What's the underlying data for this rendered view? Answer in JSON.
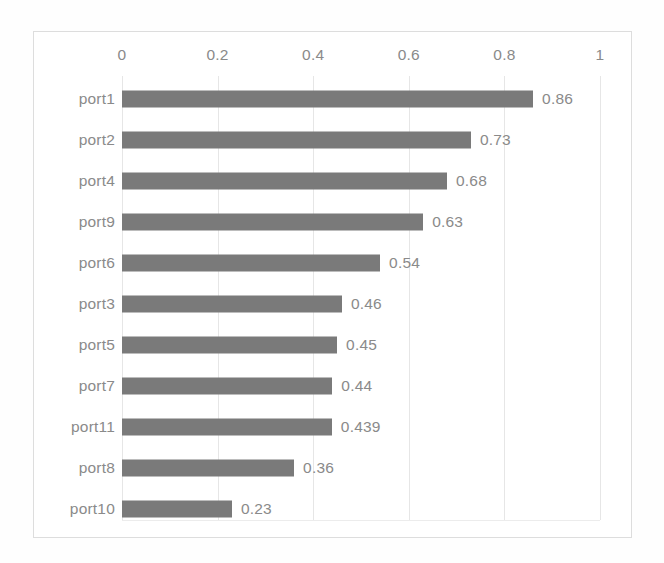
{
  "chart_data": {
    "type": "bar",
    "orientation": "horizontal",
    "title": "",
    "subtitle": "",
    "xlabel": "",
    "ylabel": "",
    "categories": [
      "port1",
      "port2",
      "port4",
      "port9",
      "port6",
      "port3",
      "port5",
      "port7",
      "port11",
      "port8",
      "port10"
    ],
    "values": [
      0.86,
      0.73,
      0.68,
      0.63,
      0.54,
      0.46,
      0.45,
      0.44,
      0.439,
      0.36,
      0.23
    ],
    "value_labels": [
      "0.86",
      "0.73",
      "0.68",
      "0.63",
      "0.54",
      "0.46",
      "0.45",
      "0.44",
      "0.439",
      "0.36",
      "0.23"
    ],
    "xlim": [
      0,
      1
    ],
    "xticks": [
      0,
      0.2,
      0.4,
      0.6,
      0.8,
      1
    ],
    "xtick_labels": [
      "0",
      "0.2",
      "0.4",
      "0.6",
      "0.8",
      "1"
    ],
    "axis_position": "top",
    "grid": true,
    "grid_axis": "x",
    "legend": false,
    "legend_position": "none",
    "data_labels": true,
    "series": [
      {
        "name": "",
        "color": "#7a7a7a",
        "values": [
          0.86,
          0.73,
          0.68,
          0.63,
          0.54,
          0.46,
          0.45,
          0.44,
          0.439,
          0.36,
          0.23
        ]
      }
    ]
  },
  "colors": {
    "bar": "#7a7a7a",
    "text": "#8a8a8a",
    "gridline": "#e6e6e6",
    "frame": "#dddddd",
    "background": "#ffffff"
  }
}
